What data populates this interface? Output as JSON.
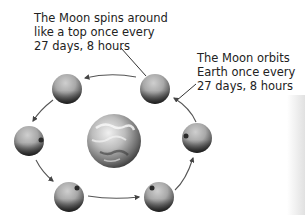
{
  "diagram": {
    "labels": {
      "spin": [
        "The Moon spins around",
        "like a top once every",
        "27 days, 8 hours"
      ],
      "orbit": [
        "The Moon orbits",
        "Earth once every",
        "27 days, 8 hours"
      ]
    },
    "center_body": {
      "name": "Earth",
      "cx": 114,
      "cy": 141,
      "r": 27
    },
    "moons": [
      {
        "id": "moon-top-right",
        "cx": 155,
        "cy": 89,
        "r": 15,
        "spot": null
      },
      {
        "id": "moon-top-left",
        "cx": 67,
        "cy": 89,
        "r": 15,
        "spot": null
      },
      {
        "id": "moon-left",
        "cx": 29,
        "cy": 141,
        "r": 15,
        "spot": "right"
      },
      {
        "id": "moon-bottom-left",
        "cx": 69,
        "cy": 197,
        "r": 15,
        "spot": "upper-right"
      },
      {
        "id": "moon-bottom-right",
        "cx": 159,
        "cy": 197,
        "r": 15,
        "spot": "upper-left"
      },
      {
        "id": "moon-right",
        "cx": 197,
        "cy": 138,
        "r": 15,
        "spot": "left"
      }
    ],
    "orbit_direction": "counter-clockwise",
    "colors": {
      "text": "#222222",
      "arrow": "#444444",
      "moon_light": "#b8b8b8",
      "moon_dark": "#3a3a3a",
      "earth_light": "#e0e0e0",
      "earth_dark": "#2a2a2a"
    }
  }
}
